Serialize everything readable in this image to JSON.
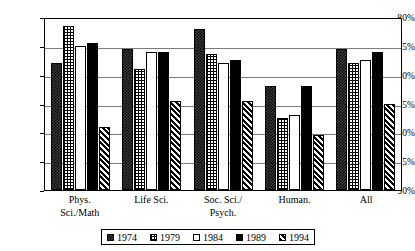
{
  "chart_data": {
    "type": "bar",
    "title": "",
    "subtitle": "",
    "xlabel": "",
    "ylabel": "",
    "ylim": [
      50,
      80
    ],
    "ytick_labels": [
      "80%",
      "75%",
      "70%",
      "65%",
      "60%",
      "55%",
      "50%"
    ],
    "ytick_values": [
      80,
      75,
      70,
      65,
      60,
      55,
      50
    ],
    "grid": true,
    "legend_position": "bottom",
    "categories": [
      "Phys. Sci./Math",
      "Life Sci.",
      "Soc. Sci./Psych.",
      "Human.",
      "All"
    ],
    "category_lines": [
      [
        "Phys.",
        "Sci./Math"
      ],
      [
        "Life Sci.",
        ""
      ],
      [
        "Soc. Sci./",
        "Psych."
      ],
      [
        "Human.",
        ""
      ],
      [
        "All",
        ""
      ]
    ],
    "series": [
      {
        "name": "1974",
        "pattern": "checkerboard",
        "values": [
          72.0,
          74.5,
          78.0,
          68.0,
          74.5
        ]
      },
      {
        "name": "1979",
        "pattern": "grid",
        "values": [
          78.5,
          71.0,
          73.5,
          62.5,
          72.0
        ]
      },
      {
        "name": "1984",
        "pattern": "white",
        "values": [
          75.0,
          74.0,
          72.0,
          63.0,
          72.5
        ]
      },
      {
        "name": "1989",
        "pattern": "solid-black",
        "values": [
          75.5,
          74.0,
          72.5,
          68.0,
          74.0
        ]
      },
      {
        "name": "1994",
        "pattern": "diagonal",
        "values": [
          61.0,
          65.5,
          65.5,
          59.5,
          65.0
        ]
      }
    ]
  },
  "legend": {
    "items": [
      {
        "label": "1974"
      },
      {
        "label": "1979"
      },
      {
        "label": "1984"
      },
      {
        "label": "1989"
      },
      {
        "label": "1994"
      }
    ]
  },
  "colors": {
    "axis": "#000000",
    "gridline": "#7a7a7a",
    "background": "#ffffff",
    "bar_dark": "#000000",
    "bar_light": "#ffffff"
  }
}
